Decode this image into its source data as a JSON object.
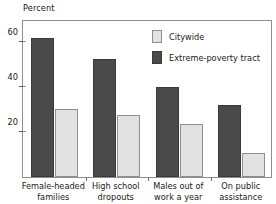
{
  "chart_data": {
    "type": "bar",
    "title": "",
    "subtitle": "",
    "xlabel": "",
    "ylabel": "Percent",
    "ylim": [
      0,
      70
    ],
    "yticks": [
      20,
      40,
      60
    ],
    "ytick_labels": [
      "20",
      "40",
      "60"
    ],
    "grid": false,
    "legend_position": "inside-top-right",
    "categories": [
      "Female-headed families",
      "High school dropouts",
      "Males out of work a year",
      "On public assistance"
    ],
    "category_lines": [
      [
        "Female-headed",
        "families"
      ],
      [
        "High school",
        "dropouts"
      ],
      [
        "Males out of",
        "work a year"
      ],
      [
        "On public",
        "assistance"
      ]
    ],
    "series": [
      {
        "name": "Extreme-poverty tract",
        "color": "#4a4a4a",
        "values": [
          61.5,
          52.5,
          40,
          32
        ]
      },
      {
        "name": "Citywide",
        "color": "#e2e2e2",
        "values": [
          30,
          27.5,
          23.5,
          10.5
        ]
      }
    ]
  },
  "axis": {
    "y_title": "Percent"
  },
  "legend": {
    "entries": [
      {
        "label": "Citywide",
        "swatch": "light"
      },
      {
        "label": "Extreme-poverty tract",
        "swatch": "dark"
      }
    ]
  },
  "colors": {
    "dark_bar": "#4a4a4a",
    "light_bar": "#e2e2e2",
    "frame": "#8e8e8e",
    "text": "#1a1a1a",
    "background": "#ffffff"
  }
}
